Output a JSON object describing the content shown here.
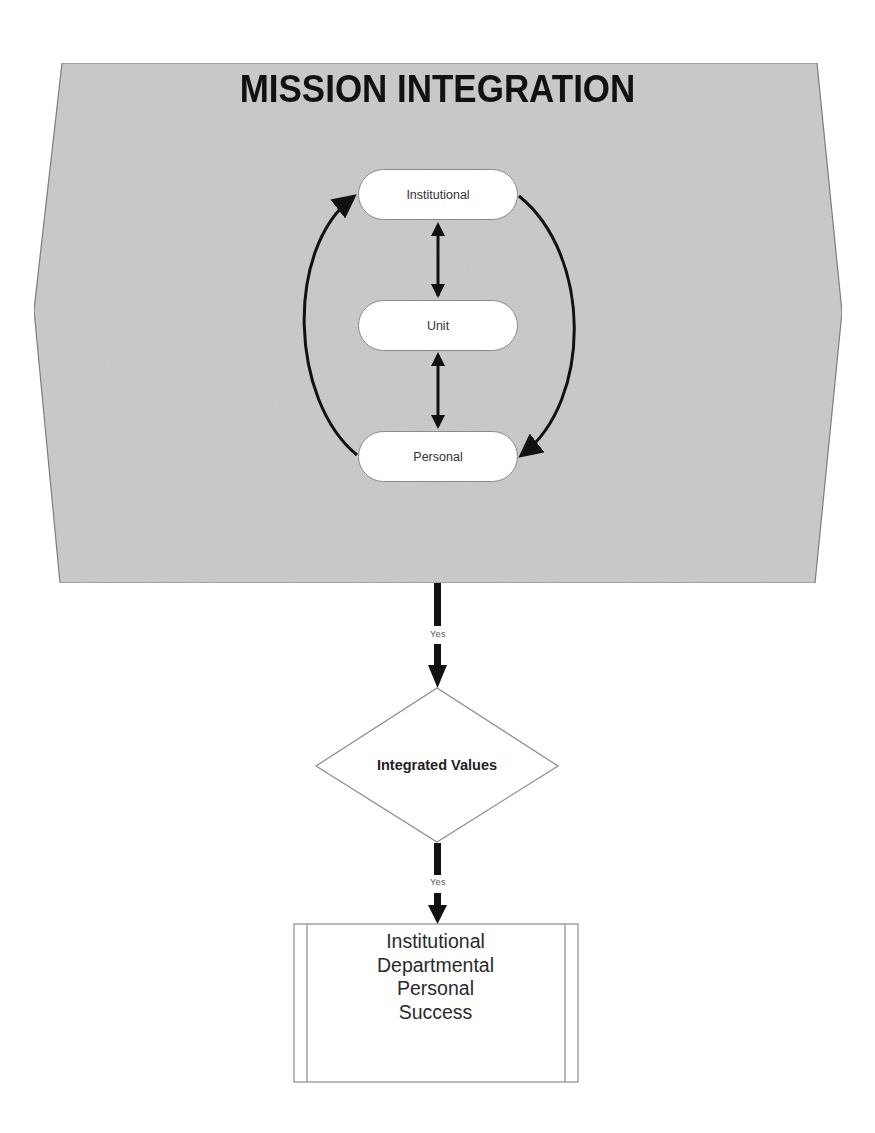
{
  "title": "MISSION INTEGRATION",
  "cycle": {
    "nodes": [
      {
        "label": "Institutional"
      },
      {
        "label": "Unit"
      },
      {
        "label": "Personal"
      }
    ],
    "edges": [
      {
        "from": "Institutional",
        "to": "Unit",
        "type": "bidirectional"
      },
      {
        "from": "Unit",
        "to": "Personal",
        "type": "bidirectional"
      },
      {
        "from": "Personal",
        "to": "Institutional",
        "type": "curved-left"
      },
      {
        "from": "Institutional",
        "to": "Personal",
        "type": "curved-right"
      }
    ]
  },
  "flow": {
    "connector1_label": "Yes",
    "decision_label": "Integrated Values",
    "connector2_label": "Yes",
    "outcome_lines": [
      "Institutional",
      "Departmental",
      "Personal",
      "Success"
    ]
  },
  "colors": {
    "panel_fill": "#c9c9c9",
    "panel_border": "#7a7a7a",
    "arrow": "#111111",
    "node_fill": "#ffffff"
  }
}
